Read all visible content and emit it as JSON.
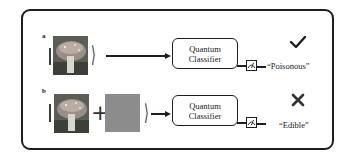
{
  "diagram": {
    "type": "quantum-adversarial-example-illustration",
    "panels": [
      {
        "label": "a",
        "input": {
          "ket_open": "|",
          "ket_close": "⟩",
          "components": [
            "mushroom-image"
          ]
        },
        "classifier_label_line1": "Quantum",
        "classifier_label_line2": "Classifier",
        "output_label": "“Poisonous”",
        "verdict_icon": "checkmark-icon",
        "verdict_symbol": "✓"
      },
      {
        "label": "b",
        "input": {
          "ket_open": "|",
          "ket_close": "⟩",
          "plus": "+",
          "components": [
            "mushroom-image",
            "gray-noise-square"
          ]
        },
        "classifier_label_line1": "Quantum",
        "classifier_label_line2": "Classifier",
        "output_label": "“Edible”",
        "verdict_icon": "cross-icon",
        "verdict_symbol": "✕"
      }
    ],
    "colors": {
      "stroke": "#1e1e1e",
      "noise_square": "#8c8c8c",
      "background": "#ffffff"
    }
  }
}
